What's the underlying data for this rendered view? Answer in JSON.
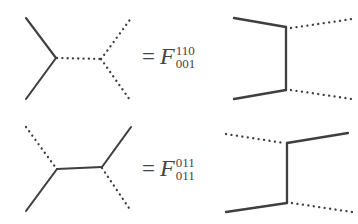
{
  "figure": {
    "background_color": "#ffffff",
    "line_color": "#3f3f3f",
    "text_color": "#454545",
    "rows": [
      {
        "id": "row-1",
        "equation": {
          "equals": "=",
          "symbol": "F",
          "superscript": "110",
          "subscript": "001"
        },
        "left_diagram": {
          "name": "y-shaped-trivalent-graph",
          "edges": [
            {
              "name": "upper-left-leg",
              "style": "solid"
            },
            {
              "name": "lower-left-leg",
              "style": "solid"
            },
            {
              "name": "internal-edge",
              "style": "dotted"
            },
            {
              "name": "upper-right-leg",
              "style": "dotted"
            },
            {
              "name": "lower-right-leg",
              "style": "dotted"
            }
          ]
        },
        "right_diagram": {
          "name": "h-shaped-trivalent-graph",
          "edges": [
            {
              "name": "upper-left-leg",
              "style": "solid"
            },
            {
              "name": "lower-left-leg",
              "style": "solid"
            },
            {
              "name": "internal-edge",
              "style": "solid"
            },
            {
              "name": "upper-right-leg",
              "style": "dotted"
            },
            {
              "name": "lower-right-leg",
              "style": "dotted"
            }
          ]
        }
      },
      {
        "id": "row-2",
        "equation": {
          "equals": "=",
          "symbol": "F",
          "superscript": "011",
          "subscript": "011"
        },
        "left_diagram": {
          "name": "y-shaped-trivalent-graph",
          "edges": [
            {
              "name": "upper-left-leg",
              "style": "dotted"
            },
            {
              "name": "lower-left-leg",
              "style": "solid"
            },
            {
              "name": "internal-edge",
              "style": "solid"
            },
            {
              "name": "upper-right-leg",
              "style": "solid"
            },
            {
              "name": "lower-right-leg",
              "style": "dotted"
            }
          ]
        },
        "right_diagram": {
          "name": "h-shaped-trivalent-graph",
          "edges": [
            {
              "name": "upper-left-leg",
              "style": "dotted"
            },
            {
              "name": "lower-left-leg",
              "style": "solid"
            },
            {
              "name": "internal-edge",
              "style": "solid"
            },
            {
              "name": "upper-right-leg",
              "style": "solid"
            },
            {
              "name": "lower-right-leg",
              "style": "dotted"
            }
          ]
        }
      }
    ]
  }
}
